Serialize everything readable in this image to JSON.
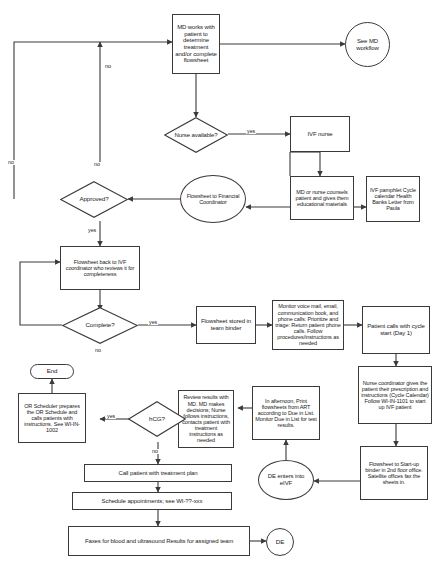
{
  "diagram": {
    "type": "flowchart",
    "orientation": "top-down",
    "nodes": [
      {
        "id": "md_works",
        "shape": "rectangle",
        "text": "MD works with patient to determine treatment and/or complete flowsheet"
      },
      {
        "id": "see_md",
        "shape": "circle",
        "text": "See MD workflow"
      },
      {
        "id": "nurse_available",
        "shape": "diamond",
        "text": "Nurse available?"
      },
      {
        "id": "ivf_nurse",
        "shape": "rectangle",
        "text": "IVF nurse"
      },
      {
        "id": "md_or_nurse",
        "shape": "rectangle",
        "text": "MD or nurse counsels patient and gives them educational materials"
      },
      {
        "id": "ivf_pamphlet",
        "shape": "rectangle",
        "text": "IVF pamphlet Cycle calendar Health Banks Letter from Paula"
      },
      {
        "id": "flowsheet_fin",
        "shape": "ellipse",
        "text": "Flowsheet to Financial Coordinator"
      },
      {
        "id": "approved",
        "shape": "diamond",
        "text": "Approved?"
      },
      {
        "id": "flowsheet_back",
        "shape": "rectangle",
        "text": "Flowsheet back to IVF coordinator who reviews it for completeness"
      },
      {
        "id": "complete",
        "shape": "diamond",
        "text": "Complete?"
      },
      {
        "id": "stored_binder",
        "shape": "rectangle",
        "text": "Flowsheet stored in team binder"
      },
      {
        "id": "monitor",
        "shape": "rectangle",
        "text": "Monitor voice mail, email, communication book, and phone calls: Prioritize and triage: Return patient phone calls. Follow procedures/instructions as needed"
      },
      {
        "id": "patient_calls",
        "shape": "rectangle",
        "text": "Patient calls with cycle start (Day 1)"
      },
      {
        "id": "nurse_coord",
        "shape": "rectangle",
        "text": "Nurse coordinator gives the patient their prescription and instructions (Cycle Calendar) Follow WI-IN-1101 to start up IVF patient"
      },
      {
        "id": "startup_binder",
        "shape": "rectangle",
        "text": "Flowsheet to Start-up binder in 2nd floor office. Satellite offices fax the sheets in."
      },
      {
        "id": "de_enters",
        "shape": "ellipse",
        "text": "DE enters into eIVF"
      },
      {
        "id": "afternoon",
        "shape": "rectangle",
        "text": "In afternoon, Print flowsheets from ART according to Due in List. Monitor Due in List for test results."
      },
      {
        "id": "review_results",
        "shape": "rectangle",
        "text": "Review results with MD. MD makes decisions; Nurse follows instructions, contacts patient with treatment instructions as needed"
      },
      {
        "id": "hcg",
        "shape": "diamond",
        "text": "hCG?"
      },
      {
        "id": "or_scheduler",
        "shape": "rectangle",
        "text": "OR Scheduler prepares the OR Schedule and calls patients with instructions. See WI-IN-1002"
      },
      {
        "id": "end",
        "shape": "rounded",
        "text": "End"
      },
      {
        "id": "call_patient",
        "shape": "rectangle",
        "text": "Call patient with treatment plan"
      },
      {
        "id": "schedule_appts",
        "shape": "rectangle",
        "text": "Schedule appointments; see WI-??-xxx"
      },
      {
        "id": "faxes",
        "shape": "rectangle",
        "text": "Faxes for blood and ultrasound Results for assigned team"
      },
      {
        "id": "de",
        "shape": "circle",
        "text": "DE"
      }
    ],
    "edge_labels": [
      {
        "id": "nurse_yes",
        "text": "yes"
      },
      {
        "id": "nurse_no",
        "text": "no"
      },
      {
        "id": "approved_no",
        "text": "no"
      },
      {
        "id": "approved_yes",
        "text": "yes"
      },
      {
        "id": "complete_no",
        "text": "no"
      },
      {
        "id": "complete_yes",
        "text": "yes"
      },
      {
        "id": "hcg_yes",
        "text": "yes"
      },
      {
        "id": "hcg_no",
        "text": "no"
      }
    ],
    "colors": {
      "stroke": "#3a3a3a",
      "text": "#1a1a1a",
      "background": "#ffffff"
    }
  }
}
